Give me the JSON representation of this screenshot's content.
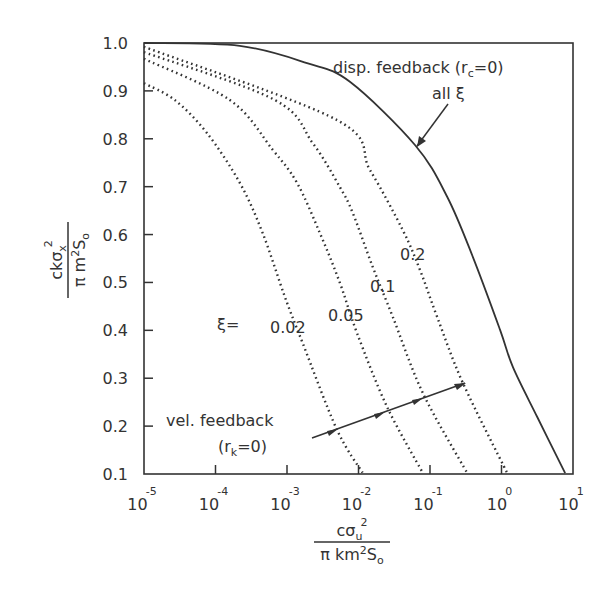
{
  "chart_data": {
    "type": "line",
    "title": "",
    "xlabel": "c σu² / (π k m² S₀)",
    "ylabel": "c k σx² / (π m² S₀)",
    "xscale": "log",
    "xlim": [
      1e-05,
      10
    ],
    "ylim": [
      0.1,
      1.0
    ],
    "grid": false,
    "x_ticks": [
      {
        "base": "10",
        "exp": "-5"
      },
      {
        "base": "10",
        "exp": "-4"
      },
      {
        "base": "10",
        "exp": "-3"
      },
      {
        "base": "10",
        "exp": "-2"
      },
      {
        "base": "10",
        "exp": "-1"
      },
      {
        "base": "10",
        "exp": "0"
      },
      {
        "base": "10",
        "exp": "1"
      }
    ],
    "y_ticks": [
      "1.0",
      "0.9",
      "0.8",
      "0.7",
      "0.6",
      "0.5",
      "0.4",
      "0.3",
      "0.2",
      "0.1"
    ],
    "series": [
      {
        "name": "disp. feedback (r_c=0), all ξ",
        "style": "solid",
        "log10_x": [
          -5,
          -3.66,
          -2.72,
          -2.12,
          -1.21,
          -0.76,
          -0.4,
          -0.02,
          0.16,
          0.5,
          0.89
        ],
        "y": [
          1.0,
          0.994,
          0.958,
          0.919,
          0.787,
          0.679,
          0.553,
          0.401,
          0.323,
          0.219,
          0.102
        ]
      },
      {
        "name": "ξ = 0.2",
        "style": "dotted",
        "log10_x": [
          -5,
          -2.3,
          -1.84,
          -1.38,
          -1.14,
          -0.9,
          -0.54,
          0.08
        ],
        "y": [
          0.992,
          0.839,
          0.735,
          0.609,
          0.526,
          0.428,
          0.29,
          0.102
        ]
      },
      {
        "name": "ξ = 0.1",
        "style": "dotted",
        "log10_x": [
          -5,
          -3.17,
          -2.64,
          -2.26,
          -2.08,
          -1.8,
          -1.52,
          -1.1,
          -0.48
        ],
        "y": [
          0.981,
          0.881,
          0.791,
          0.699,
          0.645,
          0.532,
          0.428,
          0.269,
          0.102
        ]
      },
      {
        "name": "ξ = 0.05",
        "style": "dotted",
        "log10_x": [
          -5,
          -3.8,
          -3.2,
          -2.86,
          -2.54,
          -2.26,
          -2.02,
          -1.6,
          -1.1
        ],
        "y": [
          0.967,
          0.881,
          0.777,
          0.708,
          0.603,
          0.499,
          0.394,
          0.24,
          0.102
        ]
      },
      {
        "name": "ξ = 0.02",
        "style": "dotted",
        "log10_x": [
          -5,
          -4.57,
          -4.12,
          -3.66,
          -3.34,
          -3.03,
          -2.78,
          -2.3,
          -1.94
        ],
        "y": [
          0.916,
          0.881,
          0.812,
          0.708,
          0.603,
          0.47,
          0.373,
          0.192,
          0.102
        ]
      }
    ],
    "annotations": {
      "disp_feedback": "disp. feedback (r",
      "disp_sub": "c",
      "disp_tail": "=0)",
      "all_xi": "all ξ",
      "xi_eq": "ξ=",
      "xi_labels": [
        "0.02",
        "0.05",
        "0.1",
        "0.2"
      ],
      "vel_feedback": "vel. feedback",
      "vel_paren_open": "(r",
      "vel_sub": "k",
      "vel_tail": "=0)"
    },
    "axis_labels": {
      "y_num": "ckσ",
      "y_num_sub": "x",
      "y_num_sup": "2",
      "y_den": "π m",
      "y_den_sup": "2",
      "y_den_tail": "S",
      "y_den_sub": "o",
      "x_num": "cσ",
      "x_num_sub": "u",
      "x_num_sup": "2",
      "x_den": "π km",
      "x_den_sup": "2",
      "x_den_tail": "S",
      "x_den_sub": "o"
    }
  }
}
